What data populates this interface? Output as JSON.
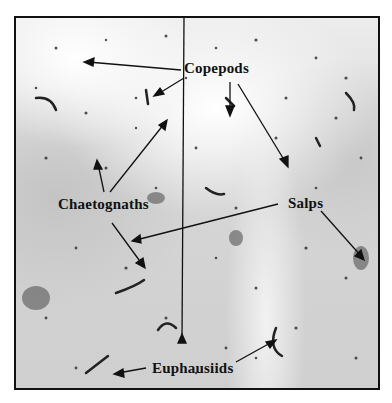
{
  "figure": {
    "labels": {
      "copepods": "Copepods",
      "chaetognaths": "Chaetognaths",
      "salps": "Salps",
      "euphausiids": "Euphausiids"
    },
    "colors": {
      "frame": "#111111",
      "text": "#111111",
      "arrow": "#111111",
      "background": "#ffffff"
    }
  }
}
